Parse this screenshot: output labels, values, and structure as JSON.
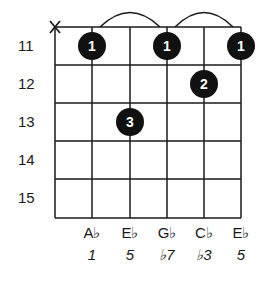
{
  "muted_string_marker": "X",
  "fret_numbers": [
    "11",
    "12",
    "13",
    "14",
    "15"
  ],
  "strings": 6,
  "frets_shown": 5,
  "fingers": [
    {
      "string": 2,
      "fret": 11,
      "finger": "1"
    },
    {
      "string": 4,
      "fret": 11,
      "finger": "1"
    },
    {
      "string": 6,
      "fret": 11,
      "finger": "1"
    },
    {
      "string": 5,
      "fret": 12,
      "finger": "2"
    },
    {
      "string": 3,
      "fret": 13,
      "finger": "3"
    }
  ],
  "ties": [
    {
      "from_string": 2,
      "to_string": 4
    },
    {
      "from_string": 4,
      "to_string": 6
    }
  ],
  "notes": [
    "A♭",
    "E♭",
    "G♭",
    "C♭",
    "E♭"
  ],
  "intervals": [
    "1",
    "5",
    "♭7",
    "♭3",
    "5"
  ],
  "colors": {
    "line": "#1a1a1a",
    "dot": "#111111",
    "dot_text": "#ffffff"
  }
}
